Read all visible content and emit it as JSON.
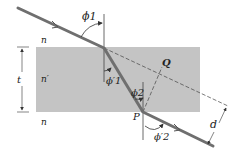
{
  "diagram": {
    "colors": {
      "slab": "#c4c4c4",
      "ray": "#6f6f6f",
      "line": "#333333",
      "background": "#ffffff"
    },
    "labels": {
      "phi1": "ϕ1",
      "phi1_prime": "ϕ′1",
      "phi2": "ϕ2",
      "phi2_prime": "ϕ′2",
      "n_top": "n",
      "n_prime": "n′",
      "n_bottom": "n",
      "t": "t",
      "Q": "Q",
      "P": "P",
      "d": "d"
    },
    "regions": [
      {
        "name": "upper-medium",
        "index": "n"
      },
      {
        "name": "slab",
        "index": "n′",
        "thickness": "t"
      },
      {
        "name": "lower-medium",
        "index": "n"
      }
    ],
    "points": [
      "Q",
      "P"
    ],
    "dimensions": [
      "t",
      "d"
    ],
    "angles": [
      "ϕ1",
      "ϕ′1",
      "ϕ2",
      "ϕ′2"
    ]
  }
}
